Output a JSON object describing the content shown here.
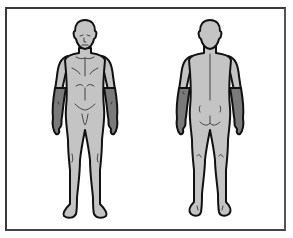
{
  "diagram": {
    "type": "body-map",
    "views": [
      {
        "label": "Front view",
        "region_highlighted": "forearms"
      },
      {
        "label": "Back view",
        "region_highlighted": "forearms"
      }
    ],
    "colors": {
      "frame": "#3a3a3a",
      "body_fill": "#c4c4c4",
      "highlight_fill": "#7a7a7a",
      "outline": "#111111",
      "background": "#ffffff"
    }
  }
}
